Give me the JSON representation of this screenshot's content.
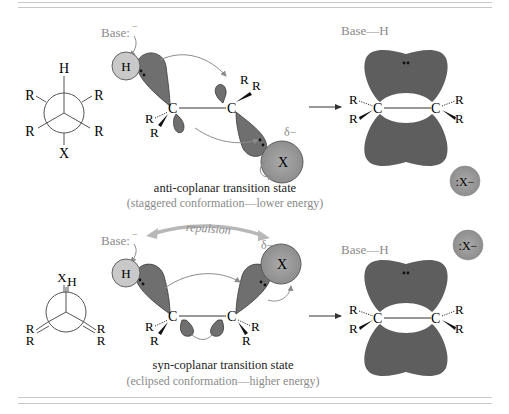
{
  "figure": {
    "top_panel": {
      "newman": {
        "front_top": "H",
        "front_bottom": "X",
        "substituents": [
          "R",
          "R",
          "R",
          "R"
        ]
      },
      "transition_state": {
        "base_label": "Base:",
        "base_charge": "−",
        "h_label": "H",
        "x_label": "X",
        "partial_charge": "δ−",
        "carbon_left": "C",
        "carbon_right": "C",
        "r_label": "R",
        "caption": "anti-coplanar transition state",
        "subcaption": "(staggered conformation—lower energy)"
      },
      "product": {
        "base_h": "Base—H",
        "carbon_left": "C",
        "carbon_right": "C",
        "r_label": "R",
        "leaving_group": ":X−"
      }
    },
    "bottom_panel": {
      "newman": {
        "front_top": "X",
        "back_top": "H",
        "substituents": [
          "R",
          "R",
          "R",
          "R"
        ]
      },
      "transition_state": {
        "base_label": "Base:",
        "base_charge": "−",
        "repulsion_label": "repulsion",
        "h_label": "H",
        "x_label": "X",
        "partial_charge": "δ−",
        "carbon_left": "C",
        "carbon_right": "C",
        "r_label": "R",
        "caption": "syn-coplanar transition state",
        "subcaption": "(eclipsed conformation—higher energy)"
      },
      "product": {
        "base_h": "Base—H",
        "carbon_left": "C",
        "carbon_right": "C",
        "r_label": "R",
        "leaving_group": ":X−"
      }
    },
    "colors": {
      "orbital_lobe": "#6f6f6f",
      "orbital_outline": "#3a3a3a",
      "h_sphere": "#c9c9c9",
      "x_sphere": "#9a9a9a",
      "pi_cloud": "#5e5e5e",
      "label_gray": "#8a8a8a",
      "arrow_gray": "#8c8c8c",
      "repulsion_arrow": "#b8b8b8"
    }
  }
}
